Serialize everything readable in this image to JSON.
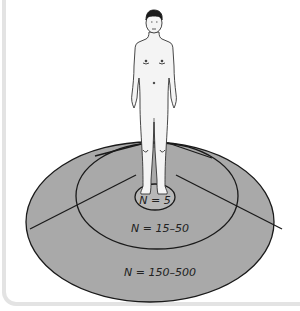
{
  "figure": {
    "top_caption_cutoff": "",
    "rings": [
      {
        "id": "inner",
        "label": "N = 5"
      },
      {
        "id": "middle",
        "label": "N = 15–50"
      },
      {
        "id": "outer",
        "label": "N = 150–500"
      }
    ],
    "colors": {
      "ring_fill": "#a9a9a9",
      "inner_fill": "#b5b5b5",
      "outline": "#1a1a1a",
      "figure_fill": "#f4f4f4",
      "frame": "#e3e3e3"
    }
  }
}
